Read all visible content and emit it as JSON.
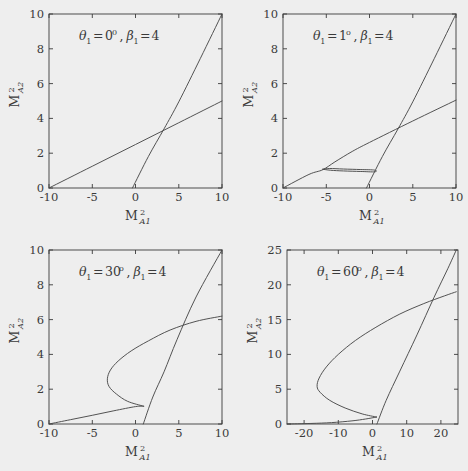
{
  "figure": {
    "background": "#eeeeee",
    "axis_color": "#3a3a3a",
    "curve_color": "#4a4a4a",
    "rows": 2,
    "cols": 2
  },
  "chart_data": [
    {
      "type": "line",
      "panel": "top-left",
      "title": "",
      "annotation": "θ₁ = 0⁰, β₁ = 4",
      "annotation_parts": {
        "theta_sub": "1",
        "theta_value": "0",
        "theta_unit": "0",
        "beta_sub": "1",
        "beta_value": "4"
      },
      "xlabel": "M²ₐ₁",
      "ylabel": "M²ₐ₂",
      "xlabel_parts": {
        "base": "M",
        "sup": "2",
        "sub": "A1"
      },
      "ylabel_parts": {
        "base": "M",
        "sup": "2",
        "sub": "A2"
      },
      "xlim": [
        -10,
        10
      ],
      "ylim": [
        0,
        10
      ],
      "xticks": [
        -10,
        -5,
        0,
        5,
        10
      ],
      "yticks": [
        0,
        2,
        4,
        6,
        8,
        10
      ],
      "grid": false,
      "legend": "none",
      "series": [
        {
          "name": "shallow-branch",
          "points": [
            [
              -10,
              0
            ],
            [
              -5,
              1.25
            ],
            [
              0,
              2.5
            ],
            [
              5,
              3.75
            ],
            [
              10,
              5.0
            ]
          ]
        },
        {
          "name": "steep-branch",
          "points": [
            [
              -0.35,
              0
            ],
            [
              1.5,
              1.82
            ],
            [
              3.3,
              3.4
            ],
            [
              5,
              4.95
            ],
            [
              7.5,
              7.45
            ],
            [
              10,
              10
            ]
          ]
        }
      ]
    },
    {
      "type": "line",
      "panel": "top-right",
      "title": "",
      "annotation": "θ₁ = 1°, β₁ = 4",
      "annotation_parts": {
        "theta_sub": "1",
        "theta_value": "1",
        "theta_unit": "o",
        "beta_sub": "1",
        "beta_value": "4"
      },
      "xlabel": "M²ₐ₁",
      "ylabel": "M²ₐ₂",
      "xlabel_parts": {
        "base": "M",
        "sup": "2",
        "sub": "A1"
      },
      "ylabel_parts": {
        "base": "M",
        "sup": "2",
        "sub": "A2"
      },
      "xlim": [
        -10,
        10
      ],
      "ylim": [
        0,
        10
      ],
      "xticks": [
        -10,
        -5,
        0,
        5,
        10
      ],
      "yticks": [
        0,
        2,
        4,
        6,
        8,
        10
      ],
      "grid": false,
      "legend": "none",
      "series": [
        {
          "name": "shallow-branch",
          "points": [
            [
              -10,
              0
            ],
            [
              -7,
              0.78
            ],
            [
              -5.4,
              1.05
            ],
            [
              -4,
              1.5
            ],
            [
              -2,
              2.1
            ],
            [
              0,
              2.62
            ],
            [
              5,
              3.85
            ],
            [
              10,
              5.05
            ]
          ]
        },
        {
          "name": "steep-branch",
          "points": [
            [
              -0.35,
              0
            ],
            [
              1.5,
              1.82
            ],
            [
              3.3,
              3.4
            ],
            [
              5,
              4.95
            ],
            [
              7.5,
              7.45
            ],
            [
              10,
              10
            ]
          ]
        },
        {
          "name": "detached-bubble",
          "points": [
            [
              -5.4,
              1.08
            ],
            [
              -4.5,
              1.02
            ],
            [
              -3,
              0.98
            ],
            [
              -1,
              0.95
            ],
            [
              0.6,
              0.93
            ],
            [
              0.6,
              1.03
            ],
            [
              -1,
              1.06
            ],
            [
              -3,
              1.09
            ],
            [
              -4.6,
              1.12
            ],
            [
              -5.4,
              1.08
            ]
          ]
        }
      ]
    },
    {
      "type": "line",
      "panel": "bottom-left",
      "title": "",
      "annotation": "θ₁ = 30°, β₁ = 4",
      "annotation_parts": {
        "theta_sub": "1",
        "theta_value": "30",
        "theta_unit": "o",
        "beta_sub": "1",
        "beta_value": "4"
      },
      "xlabel": "M²ₐ₁",
      "ylabel": "M²ₐ₂",
      "xlabel_parts": {
        "base": "M",
        "sup": "2",
        "sub": "A1"
      },
      "ylabel_parts": {
        "base": "M",
        "sup": "2",
        "sub": "A2"
      },
      "xlim": [
        -10,
        10
      ],
      "ylim": [
        0,
        10
      ],
      "xticks": [
        -10,
        -5,
        0,
        5,
        10
      ],
      "yticks": [
        0,
        2,
        4,
        6,
        8,
        10
      ],
      "grid": false,
      "legend": "none",
      "series": [
        {
          "name": "lower-branch",
          "points": [
            [
              -10,
              0
            ],
            [
              -7.5,
              0.25
            ],
            [
              -5,
              0.5
            ],
            [
              -2.5,
              0.76
            ],
            [
              0,
              1.0
            ],
            [
              0.95,
              1.02
            ]
          ]
        },
        {
          "name": "steep-branch",
          "points": [
            [
              0.9,
              0
            ],
            [
              2,
              1.55
            ],
            [
              3.3,
              3.0
            ],
            [
              4.8,
              4.85
            ],
            [
              7,
              7.3
            ],
            [
              10,
              10
            ]
          ]
        },
        {
          "name": "c-shaped-branch",
          "points": [
            [
              0.95,
              1.02
            ],
            [
              -0.9,
              1.3
            ],
            [
              -2.2,
              1.72
            ],
            [
              -3.05,
              2.15
            ],
            [
              -3.25,
              2.6
            ],
            [
              -2.9,
              3.1
            ],
            [
              -2.0,
              3.62
            ],
            [
              -0.5,
              4.2
            ],
            [
              1.5,
              4.78
            ],
            [
              4.0,
              5.4
            ],
            [
              7.0,
              5.9
            ],
            [
              10,
              6.2
            ]
          ]
        }
      ]
    },
    {
      "type": "line",
      "panel": "bottom-right",
      "title": "",
      "annotation": "θ₁ = 60°, β₁ = 4",
      "annotation_parts": {
        "theta_sub": "1",
        "theta_value": "60",
        "theta_unit": "o",
        "beta_sub": "1",
        "beta_value": "4"
      },
      "xlabel": "M²ₐ₁",
      "ylabel": "M²ₐ₂",
      "xlabel_parts": {
        "base": "M",
        "sup": "2",
        "sub": "A1"
      },
      "ylabel_parts": {
        "base": "M",
        "sup": "2",
        "sub": "A2"
      },
      "xlim": [
        -25,
        25
      ],
      "ylim": [
        0,
        25
      ],
      "xticks": [
        -20,
        -10,
        0,
        10,
        20
      ],
      "yticks": [
        0,
        5,
        10,
        15,
        20,
        25
      ],
      "grid": false,
      "legend": "none",
      "series": [
        {
          "name": "lower-branch",
          "points": [
            [
              -25,
              0
            ],
            [
              -18,
              0.08
            ],
            [
              -12,
              0.2
            ],
            [
              -6,
              0.45
            ],
            [
              -2,
              0.72
            ],
            [
              1.2,
              1.0
            ]
          ]
        },
        {
          "name": "steep-branch",
          "points": [
            [
              1.3,
              0
            ],
            [
              4,
              3.4
            ],
            [
              8,
              7.6
            ],
            [
              13,
              12.8
            ],
            [
              18,
              18.2
            ],
            [
              22,
              22.3
            ],
            [
              24.5,
              25
            ]
          ]
        },
        {
          "name": "c-shaped-branch",
          "points": [
            [
              1.2,
              1.0
            ],
            [
              -3,
              1.45
            ],
            [
              -8,
              2.3
            ],
            [
              -12.5,
              3.4
            ],
            [
              -15.3,
              4.55
            ],
            [
              -16.2,
              5.4
            ],
            [
              -15.6,
              6.6
            ],
            [
              -13.5,
              8.2
            ],
            [
              -10,
              10.0
            ],
            [
              -5,
              12.0
            ],
            [
              1,
              13.9
            ],
            [
              8,
              15.8
            ],
            [
              15,
              17.3
            ],
            [
              21,
              18.4
            ],
            [
              24.5,
              19.0
            ]
          ]
        }
      ]
    }
  ]
}
